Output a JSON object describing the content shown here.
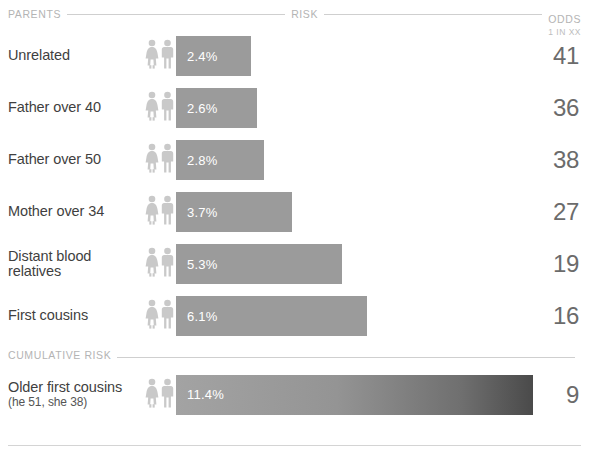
{
  "header": {
    "parents_label": "PARENTS",
    "risk_label": "RISK",
    "odds_label": "ODDS",
    "odds_sublabel": "1 IN XX"
  },
  "section": {
    "cumulative_label": "CUMULATIVE RISK"
  },
  "icons": {
    "female": "female-figure-icon",
    "male": "male-figure-icon"
  },
  "colors": {
    "bar": "#9b9b9b",
    "bar_gradient_end": "#4a4a4a",
    "text": "#3f3f3f",
    "muted": "#b4b4b4",
    "rule": "#cfcfcf"
  },
  "rows": [
    {
      "label": "Unrelated",
      "sub": "",
      "risk": "2.4%",
      "risk_value": 2.4,
      "odds": "41"
    },
    {
      "label": "Father over 40",
      "sub": "",
      "risk": "2.6%",
      "risk_value": 2.6,
      "odds": "36"
    },
    {
      "label": "Father over 50",
      "sub": "",
      "risk": "2.8%",
      "risk_value": 2.8,
      "odds": "38"
    },
    {
      "label": "Mother over 34",
      "sub": "",
      "risk": "3.7%",
      "risk_value": 3.7,
      "odds": "27"
    },
    {
      "label": "Distant blood relatives",
      "sub": "",
      "risk": "5.3%",
      "risk_value": 5.3,
      "odds": "19"
    },
    {
      "label": "First cousins",
      "sub": "",
      "risk": "6.1%",
      "risk_value": 6.1,
      "odds": "16"
    }
  ],
  "cumulative_rows": [
    {
      "label": "Older first cousins",
      "sub": "(he 51, she 38)",
      "risk": "11.4%",
      "risk_value": 11.4,
      "odds": "9"
    }
  ],
  "chart_data": {
    "type": "bar",
    "title": "",
    "xlabel": "RISK",
    "ylabel": "PARENTS",
    "orientation": "horizontal",
    "grid": false,
    "legend": "none",
    "xlim": [
      0,
      11.4
    ],
    "categories": [
      "Unrelated",
      "Father over 40",
      "Father over 50",
      "Mother over 34",
      "Distant blood relatives",
      "First cousins",
      "Older first cousins (he 51, she 38)"
    ],
    "values": [
      2.4,
      2.6,
      2.8,
      3.7,
      5.3,
      6.1,
      11.4
    ],
    "value_labels": [
      "2.4%",
      "2.6%",
      "2.8%",
      "3.7%",
      "5.3%",
      "6.1%",
      "11.4%"
    ],
    "secondary_axis_label": "ODDS 1 IN XX",
    "secondary_values": [
      41,
      36,
      38,
      27,
      19,
      16,
      9
    ],
    "annotations": [
      "CUMULATIVE RISK applies to the final row"
    ]
  }
}
